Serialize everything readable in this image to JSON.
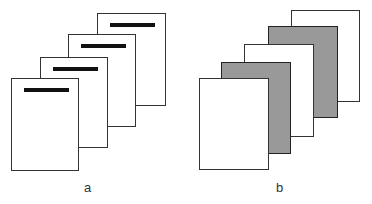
{
  "panels": [
    {
      "label": "a",
      "description": "stack of four pages each with a black header bar",
      "pages": [
        {
          "x": 97,
          "y": 13,
          "w": 69,
          "h": 93,
          "fill": "#ffffff",
          "bar": true
        },
        {
          "x": 68,
          "y": 34,
          "w": 68,
          "h": 93,
          "fill": "#ffffff",
          "bar": true
        },
        {
          "x": 40,
          "y": 57,
          "w": 68,
          "h": 91,
          "fill": "#ffffff",
          "bar": true
        },
        {
          "x": 11,
          "y": 78,
          "w": 68,
          "h": 93,
          "fill": "#ffffff",
          "bar": true
        }
      ]
    },
    {
      "label": "b",
      "description": "stack of five pages alternating white and gray",
      "pages": [
        {
          "x": 291,
          "y": 10,
          "w": 69,
          "h": 92,
          "fill": "#ffffff",
          "bar": false
        },
        {
          "x": 268,
          "y": 26,
          "w": 70,
          "h": 92,
          "fill": "#999999",
          "bar": false
        },
        {
          "x": 244,
          "y": 44,
          "w": 70,
          "h": 93,
          "fill": "#ffffff",
          "bar": false
        },
        {
          "x": 221,
          "y": 62,
          "w": 70,
          "h": 92,
          "fill": "#999999",
          "bar": false
        },
        {
          "x": 199,
          "y": 78,
          "w": 70,
          "h": 92,
          "fill": "#ffffff",
          "bar": false
        }
      ]
    }
  ]
}
